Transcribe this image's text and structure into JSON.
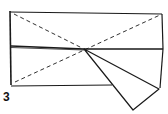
{
  "diagram": {
    "step_number": "3",
    "colors": {
      "line": "#1a1a1a",
      "background": "#ffffff"
    }
  }
}
